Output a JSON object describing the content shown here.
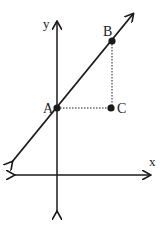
{
  "diagram": {
    "type": "coordinate-plane",
    "axes": {
      "x_label": "x",
      "y_label": "y"
    },
    "line": {
      "description": "line with positive slope through A and B, arrows at both ends"
    },
    "points": [
      {
        "label": "A",
        "position": "on y-axis, on line"
      },
      {
        "label": "B",
        "position": "on line, upper right"
      },
      {
        "label": "C",
        "position": "below B, right of A (right-angle vertex)"
      }
    ],
    "segments": [
      {
        "from": "A",
        "to": "C",
        "style": "dotted"
      },
      {
        "from": "B",
        "to": "C",
        "style": "dotted"
      }
    ],
    "colors": {
      "stroke": "#1a1a1a",
      "background": "#ffffff"
    }
  }
}
